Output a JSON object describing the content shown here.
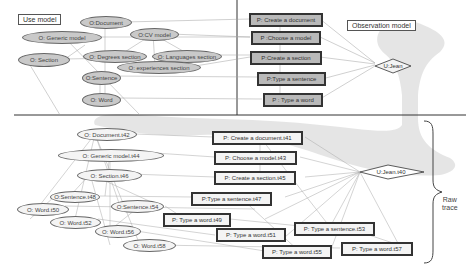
{
  "panels": {
    "use_model_label": "Use model",
    "observation_model_label": "Observation model",
    "raw_trace_label_line1": "Raw",
    "raw_trace_label_line2": "trace"
  },
  "use_model": {
    "objects": [
      {
        "id": "doc",
        "label": "O:Document"
      },
      {
        "id": "gen",
        "label": "O: Generic model"
      },
      {
        "id": "cv",
        "label": "O:CV model"
      },
      {
        "id": "sec",
        "label": "O: Section"
      },
      {
        "id": "deg",
        "label": "O: Degrees section"
      },
      {
        "id": "lang",
        "label": "O: Languages section"
      },
      {
        "id": "exp",
        "label": "O: experiences section"
      },
      {
        "id": "sent",
        "label": "O:Sentence"
      },
      {
        "id": "word",
        "label": "O: Word"
      }
    ]
  },
  "observation_model": {
    "processes": [
      {
        "id": "p_doc",
        "label": "P: Create a document"
      },
      {
        "id": "p_model",
        "label": "P :Choose a model"
      },
      {
        "id": "p_sec",
        "label": "P:Create a section"
      },
      {
        "id": "p_sent",
        "label": "P:Type a sentence"
      },
      {
        "id": "p_word",
        "label": "P : Type a word"
      }
    ],
    "user": {
      "label": "U:Jean"
    }
  },
  "raw_trace": {
    "objects": [
      {
        "id": "t42",
        "label": "O: Document.t42"
      },
      {
        "id": "t44",
        "label": "O: Generic model.t44"
      },
      {
        "id": "t46",
        "label": "O: Section.t46"
      },
      {
        "id": "t48",
        "label": "O:Sentence.t48"
      },
      {
        "id": "t50",
        "label": "O: Word.t50"
      },
      {
        "id": "t52",
        "label": "O: Word.t52"
      },
      {
        "id": "t54",
        "label": "O:Sentence.t54"
      },
      {
        "id": "t56",
        "label": "O: Word.t56"
      },
      {
        "id": "t58",
        "label": "O: Word.t58"
      }
    ],
    "processes": [
      {
        "id": "t41",
        "label": "P: Create a document.t41"
      },
      {
        "id": "t43",
        "label": "P: Choose a model.t43"
      },
      {
        "id": "t45",
        "label": "P: Create a section.t45"
      },
      {
        "id": "t47",
        "label": "P:Type a sentence.t47"
      },
      {
        "id": "t49",
        "label": "P: Type a word.t49"
      },
      {
        "id": "t51",
        "label": "P: Type a word.t51"
      },
      {
        "id": "t53",
        "label": "P: Type a sentence.t53"
      },
      {
        "id": "t55",
        "label": "P: Type a word.t55"
      },
      {
        "id": "t57",
        "label": "P: Type a word.t57"
      }
    ],
    "user": {
      "label": "U:Jean.t40"
    }
  },
  "colors": {
    "model_fill": "#c9c9c9",
    "highlight_band": "#d8d8d8",
    "edge": "#9a9a9a",
    "divider": "#333333"
  }
}
